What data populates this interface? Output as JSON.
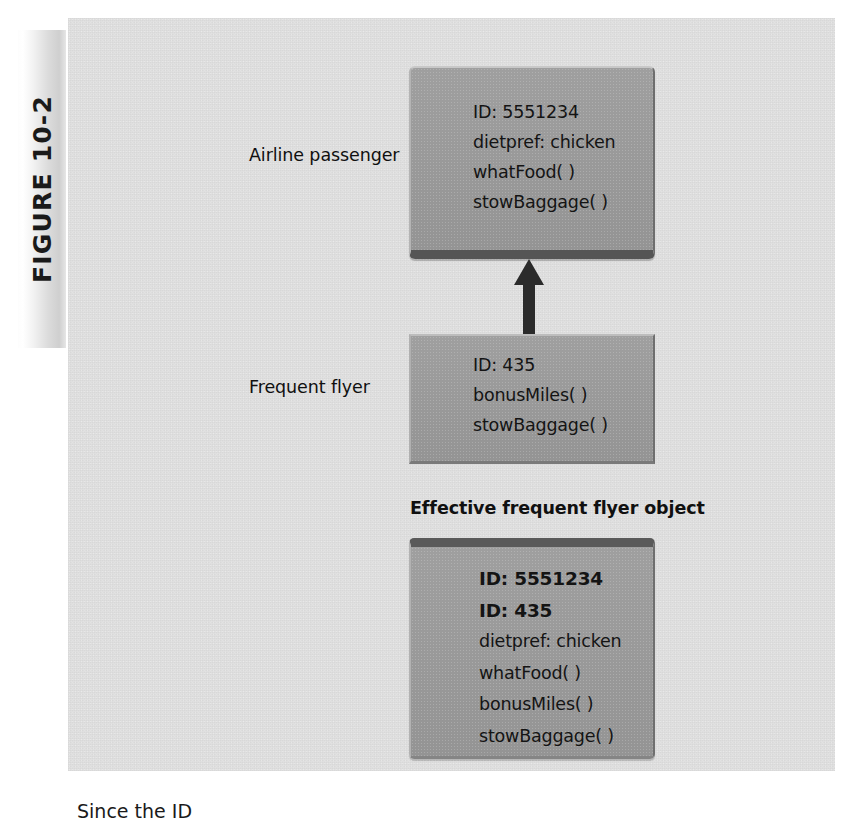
{
  "figure": {
    "tab_label": "FIGURE 10-2",
    "caption": "Since the ID"
  },
  "labels": {
    "airline_passenger": "Airline passenger",
    "frequent_flyer": "Frequent flyer",
    "effective_object": "Effective frequent flyer object"
  },
  "diagram": {
    "type": "object-inheritance-diagram",
    "arrow": {
      "name": "inheritance-arrow",
      "direction": "up",
      "from": "frequent-flyer-box",
      "to": "airline-passenger-box"
    },
    "boxes": [
      {
        "id": "airline-passenger-box",
        "title": "Airline passenger",
        "lines": [
          {
            "text": "ID: 5551234",
            "bold": false
          },
          {
            "text": "dietpref: chicken",
            "bold": false
          },
          {
            "text": "whatFood( )",
            "bold": false
          },
          {
            "text": "stowBaggage( )",
            "bold": false
          }
        ]
      },
      {
        "id": "frequent-flyer-box",
        "title": "Frequent flyer",
        "lines": [
          {
            "text": "ID: 435",
            "bold": false
          },
          {
            "text": "bonusMiles( )",
            "bold": false
          },
          {
            "text": "stowBaggage( )",
            "bold": false
          }
        ]
      },
      {
        "id": "effective-frequent-flyer-box",
        "title": "Effective frequent flyer object",
        "lines": [
          {
            "text": "ID: 5551234",
            "bold": true
          },
          {
            "text": "ID: 435",
            "bold": true
          },
          {
            "text": "dietpref: chicken",
            "bold": false
          },
          {
            "text": "whatFood( )",
            "bold": false
          },
          {
            "text": "bonusMiles( )",
            "bold": false
          },
          {
            "text": "stowBaggage( )",
            "bold": false
          }
        ]
      }
    ]
  },
  "colors": {
    "page_background": "#e0e0e0",
    "box_fill": "#9a9a9a",
    "box_shadow": "#555555",
    "text": "#141414",
    "arrow": "#2b2b2b"
  }
}
